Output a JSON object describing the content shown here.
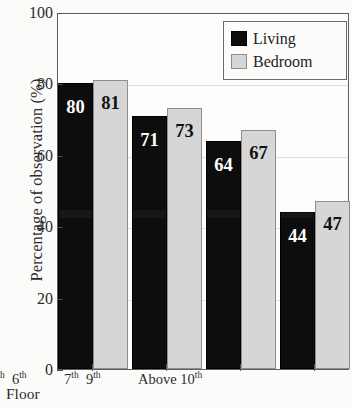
{
  "chart_data": {
    "type": "bar",
    "title": "",
    "subtitle": "",
    "xlabel": "Floor",
    "ylabel": "Percentage of observation (%)",
    "ylim": [
      0,
      100
    ],
    "yticks": [
      0,
      20,
      40,
      60,
      80,
      100
    ],
    "ytick_labels": [
      "0",
      "20",
      "40",
      "60",
      "80",
      "100"
    ],
    "grid": true,
    "grid_axis": "y",
    "legend_position": "top-right",
    "categories": [
      "1st 6rd",
      "4th 6th",
      "7th 9th",
      "Above 10th"
    ],
    "category_parts": [
      {
        "a_num": "1",
        "a_sup": "st",
        "b_num": "6",
        "b_sup": "rd"
      },
      {
        "a_num": "4",
        "a_sup": "th",
        "b_num": "6",
        "b_sup": "th"
      },
      {
        "a_num": "7",
        "a_sup": "th",
        "b_num": "9",
        "b_sup": "th"
      },
      {
        "a_num": "Above 10",
        "a_sup": "th",
        "b_num": "",
        "b_sup": ""
      }
    ],
    "series": [
      {
        "name": "Living",
        "color": "#0d0d0d",
        "values": [
          80,
          71,
          64,
          44
        ],
        "value_labels": [
          "80",
          "71",
          "64",
          "44"
        ]
      },
      {
        "name": "Bedroom",
        "color": "#d6d6d6",
        "values": [
          81,
          73,
          67,
          47
        ],
        "value_labels": [
          "81",
          "73",
          "67",
          "47"
        ]
      }
    ]
  },
  "legend": {
    "items": [
      {
        "label": "Living",
        "swatch": "living-swatch"
      },
      {
        "label": "Bedroom",
        "swatch": "bedroom-swatch"
      }
    ]
  },
  "axes": {
    "y_title": "Percentage of observation (%)",
    "x_title": "Floor",
    "y_tick_labels": [
      "100",
      "80",
      "60",
      "40",
      "20",
      "0"
    ]
  }
}
